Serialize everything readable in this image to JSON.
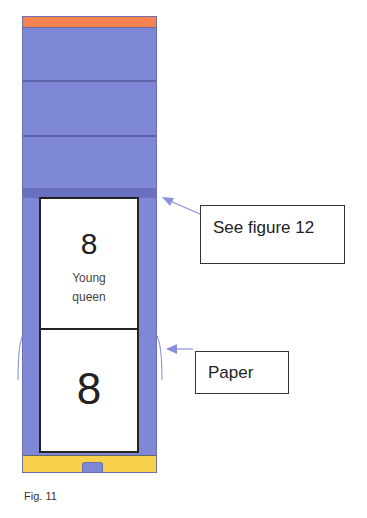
{
  "figure": {
    "caption": "Fig. 11",
    "colors": {
      "frame": "#7f88d6",
      "top_strip": "#f5824f",
      "bottom_strip": "#f8d04a",
      "arrow": "#8a90dd"
    },
    "frames": [
      {
        "number": "8",
        "label_line1": "Young",
        "label_line2": "queen"
      },
      {
        "number": "8"
      }
    ],
    "callouts": [
      {
        "text": "See figure 12"
      },
      {
        "text": "Paper"
      }
    ]
  }
}
